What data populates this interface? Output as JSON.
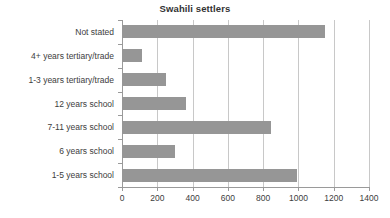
{
  "chart_data": {
    "type": "bar",
    "orientation": "horizontal",
    "title": "Swahili settlers",
    "xlabel": "",
    "ylabel": "",
    "categories": [
      "Not stated",
      "4+ years tertiary/trade",
      "1-3 years tertiary/trade",
      "12 years school",
      "7-11 years school",
      "6 years school",
      "1-5 years school"
    ],
    "values": [
      1150,
      113,
      250,
      365,
      845,
      300,
      990
    ],
    "xlim": [
      0,
      1400
    ],
    "xticks": [
      0,
      200,
      400,
      600,
      800,
      1000,
      1200,
      1400
    ],
    "xtick_labels": [
      "0",
      "200",
      "400",
      "600",
      "800",
      "1000",
      "1200",
      "1400"
    ],
    "grid": "vertical",
    "legend": null,
    "bar_color": "#969696",
    "gridline_color": "#c8c8c8",
    "axis_color": "#9a9a9a"
  }
}
